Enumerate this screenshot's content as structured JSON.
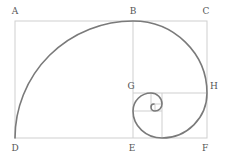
{
  "labels": {
    "A": "A",
    "B": "B",
    "C": "C",
    "D": "D",
    "E": "E",
    "F": "F",
    "G": "G",
    "H": "H"
  },
  "colors": {
    "grid": "#cfcfcf",
    "spiral": "#7a7a7a",
    "label": "#555555"
  },
  "rectangle": {
    "x": 15,
    "y": 21,
    "width": 192,
    "height": 117
  }
}
